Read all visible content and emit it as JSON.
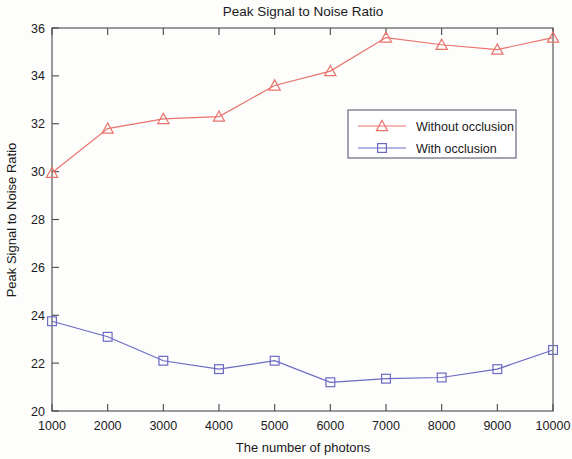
{
  "chart_data": {
    "type": "line",
    "title": "Peak Signal to Noise Ratio",
    "xlabel": "The number of photons",
    "ylabel": "Peak Signal to Noise Ratio",
    "x": [
      1000,
      2000,
      3000,
      4000,
      5000,
      6000,
      7000,
      8000,
      9000,
      10000
    ],
    "xticklabels": [
      "1000",
      "2000",
      "3000",
      "4000",
      "5000",
      "6000",
      "7000",
      "8000",
      "9000",
      "10000"
    ],
    "yticks": [
      20,
      22,
      24,
      26,
      28,
      30,
      32,
      34,
      36
    ],
    "yticklabels": [
      "20",
      "22",
      "24",
      "26",
      "28",
      "30",
      "32",
      "34",
      "36"
    ],
    "xlim": [
      1000,
      10000
    ],
    "ylim": [
      20,
      36
    ],
    "grid": false,
    "legend_position": "center-right",
    "series": [
      {
        "name": "Without occlusion",
        "color": "#e8736b",
        "marker": "triangle",
        "values": [
          29.95,
          31.8,
          32.2,
          32.3,
          33.6,
          34.2,
          35.6,
          35.3,
          35.1,
          35.6
        ]
      },
      {
        "name": "With occlusion",
        "color": "#6b6bc4",
        "marker": "square",
        "values": [
          23.75,
          23.1,
          22.1,
          21.75,
          22.1,
          21.2,
          21.35,
          21.4,
          21.75,
          22.55
        ]
      }
    ]
  }
}
